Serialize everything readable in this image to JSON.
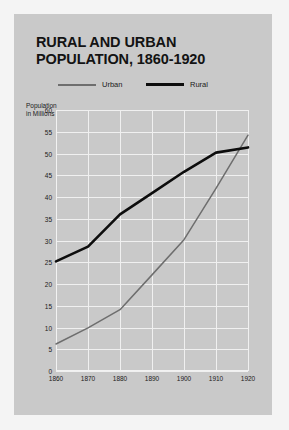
{
  "figure": {
    "title_lines": [
      "RURAL AND URBAN",
      "POPULATION, 1860-1920"
    ],
    "background_color": "#c9c9c9",
    "grid_color": "#f0f0f0",
    "page_background": "#f4f4f4"
  },
  "legend": {
    "position": "top-center",
    "items": [
      {
        "label": "Urban",
        "color": "#6e6e6e",
        "style": "thin"
      },
      {
        "label": "Rural",
        "color": "#0d0d0d",
        "style": "thick"
      }
    ]
  },
  "axes": {
    "ylabel_lines": [
      "Population",
      "in Millions"
    ],
    "yticks": [
      "60",
      "55",
      "50",
      "45",
      "40",
      "35",
      "30",
      "25",
      "20",
      "15",
      "10",
      "5",
      "0"
    ],
    "xticks": [
      "1860",
      "1870",
      "1880",
      "1890",
      "1900",
      "1910",
      "1920"
    ]
  },
  "chart_data": {
    "type": "line",
    "title": "RURAL AND URBAN POPULATION, 1860-1920",
    "xlabel": "",
    "ylabel": "Population in Millions",
    "x": [
      1860,
      1870,
      1880,
      1890,
      1900,
      1910,
      1920
    ],
    "xlim": [
      1860,
      1920
    ],
    "ylim": [
      0,
      60
    ],
    "ytick_step": 5,
    "grid": true,
    "legend_position": "top-center",
    "series": [
      {
        "name": "Urban",
        "color": "#6e6e6e",
        "linewidth": "thin",
        "values": [
          6.2,
          9.9,
          14.1,
          22.1,
          30.2,
          42.0,
          54.2
        ]
      },
      {
        "name": "Rural",
        "color": "#0d0d0d",
        "linewidth": "thick",
        "values": [
          25.2,
          28.6,
          36.0,
          40.9,
          45.8,
          50.2,
          51.4
        ]
      }
    ],
    "annotations": [
      "Urban line crosses above Rural line between 1910 and 1920"
    ]
  }
}
